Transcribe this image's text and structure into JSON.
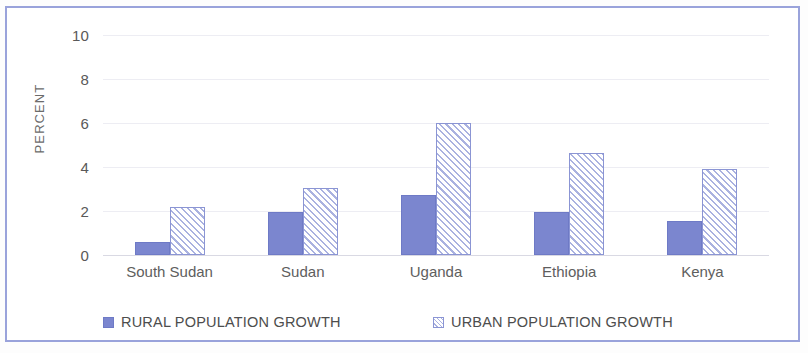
{
  "chart_data": {
    "type": "bar",
    "title": "",
    "subtitle": "",
    "xlabel": "",
    "ylabel": "PERCENT",
    "categories": [
      "South Sudan",
      "Sudan",
      "Uganda",
      "Ethiopia",
      "Kenya"
    ],
    "series": [
      {
        "name": "RURAL POPULATION GROWTH",
        "color": "#7b86cf",
        "pattern": "solid",
        "values": [
          0.6,
          1.95,
          2.75,
          1.95,
          1.55
        ]
      },
      {
        "name": "URBAN POPULATION GROWTH",
        "color": "#aab2e0",
        "pattern": "diagonal-hatch",
        "values": [
          2.2,
          3.05,
          6.0,
          4.65,
          3.9
        ]
      }
    ],
    "ylim": [
      0,
      10
    ],
    "yticks": [
      "0",
      "2",
      "4",
      "6",
      "8",
      "10"
    ],
    "ytick_values": [
      0,
      2,
      4,
      6,
      8,
      10
    ],
    "grid": true,
    "legend_position": "bottom"
  },
  "legend": {
    "items": [
      {
        "label": "RURAL POPULATION GROWTH",
        "swatch": "solid-square-icon"
      },
      {
        "label": "URBAN POPULATION GROWTH",
        "swatch": "hatched-square-icon"
      }
    ]
  },
  "colors": {
    "frame_border": "#9aa3db",
    "rural_fill": "#7b86cf",
    "urban_hatch": "#aab2e0",
    "gridline": "#ededf3",
    "axis_text": "#595959"
  }
}
